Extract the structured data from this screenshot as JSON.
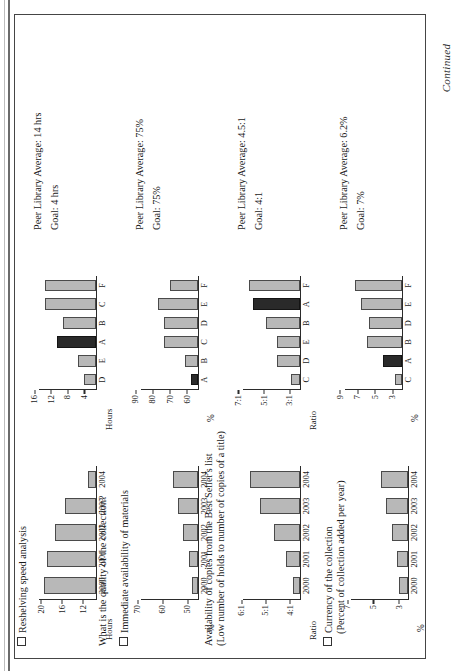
{
  "page": {
    "catchword": "Continued",
    "checkbox_icon": "empty-checkbox"
  },
  "sections": [
    {
      "heading": "Reshelving speed analysis",
      "question": "What is the quality of the collection?",
      "subhead": "",
      "notes": [
        "Peer Library Average: 14 hrs",
        "Goal: 4 hrs"
      ],
      "trend": {
        "type": "bar",
        "ylabel": "Hours",
        "categories": [
          "2000",
          "2001",
          "2002",
          "2003",
          "2004"
        ],
        "values": [
          21,
          20.5,
          19,
          17,
          12.5
        ],
        "yticks": [
          "12",
          "16",
          "20"
        ],
        "ytick_values": [
          12,
          16,
          20
        ],
        "ylim": [
          11,
          22
        ]
      },
      "peer": {
        "type": "bar",
        "ylabel": "Hours",
        "categories": [
          "D",
          "E",
          "A",
          "B",
          "C",
          "F"
        ],
        "values": [
          6,
          7.5,
          12.5,
          11,
          15.5,
          15.5
        ],
        "highlight": "A",
        "yticks": [
          "4",
          "8",
          "12",
          "16"
        ],
        "ytick_values": [
          4,
          8,
          12,
          16
        ],
        "ylim": [
          3,
          17
        ]
      }
    },
    {
      "heading": "Immediate availability of materials",
      "question": "",
      "subhead": "",
      "notes": [
        "Peer Library Average: 75%",
        "Goal: 75%"
      ],
      "trend": {
        "type": "bar",
        "ylabel": "%",
        "categories": [
          "2000",
          "2001",
          "2002",
          "2003",
          "2004"
        ],
        "values": [
          51.5,
          52.5,
          55,
          57,
          59
        ],
        "yticks": [
          "50",
          "60",
          "70"
        ],
        "ytick_values": [
          50,
          60,
          70
        ],
        "ylim": [
          49,
          72
        ]
      },
      "peer": {
        "type": "bar",
        "ylabel": "%",
        "categories": [
          "A",
          "B",
          "C",
          "D",
          "E",
          "F"
        ],
        "values": [
          62,
          66,
          78,
          78,
          82,
          75
        ],
        "highlight": "A",
        "yticks": [
          "60",
          "70",
          "80",
          "90"
        ],
        "ytick_values": [
          60,
          70,
          80,
          90
        ],
        "ylim": [
          58,
          92
        ]
      }
    },
    {
      "heading": "Availability of copies from the Best Seller's list",
      "subhead": "(Low number of holds to number of copies of a title)",
      "question": "",
      "notes": [
        "Peer Library Average: 4.5:1",
        "Goal: 4:1"
      ],
      "trend": {
        "type": "bar",
        "ylabel": "Ratio",
        "categories": [
          "2000",
          "2001",
          "2002",
          "2003",
          "2004"
        ],
        "values": [
          4.2,
          4.5,
          5.0,
          5.6,
          6.0
        ],
        "yticks": [
          "4:1",
          "5:1",
          "6:1"
        ],
        "ytick_values": [
          4,
          5,
          6
        ],
        "ylim": [
          3.9,
          6.3
        ]
      },
      "peer": {
        "type": "bar",
        "ylabel": "Ratio",
        "categories": [
          "C",
          "D",
          "E",
          "B",
          "A",
          "F"
        ],
        "values": [
          3.5,
          4.6,
          4.6,
          5.5,
          6.5,
          6.8
        ],
        "highlight": "A",
        "yticks": [
          "3:1",
          "5:1",
          "7:1"
        ],
        "ytick_values": [
          3,
          5,
          7
        ],
        "ylim": [
          2.8,
          7.3
        ]
      }
    },
    {
      "heading": "Currency of the collection",
      "subhead": "(Percent of collection added per year)",
      "question": "",
      "notes": [
        "Peer Library Average: 6.2%",
        "Goal: 7%"
      ],
      "trend": {
        "type": "bar",
        "ylabel": "%",
        "categories": [
          "2000",
          "2001",
          "2002",
          "2003",
          "2004"
        ],
        "values": [
          3.6,
          3.8,
          4.2,
          4.6,
          5.0
        ],
        "yticks": [
          "3",
          "5",
          "7"
        ],
        "ytick_values": [
          3,
          5,
          7
        ],
        "ylim": [
          2.9,
          7.4
        ]
      },
      "peer": {
        "type": "bar",
        "ylabel": "%",
        "categories": [
          "C",
          "A",
          "B",
          "D",
          "E",
          "F"
        ],
        "values": [
          3.6,
          5.0,
          6.8,
          6.6,
          7.6,
          8.2
        ],
        "highlight": "A",
        "yticks": [
          "3",
          "5",
          "7",
          "9"
        ],
        "ytick_values": [
          3,
          5,
          7,
          9
        ],
        "ylim": [
          2.8,
          9.4
        ]
      }
    }
  ],
  "colors": {
    "bar_fill": "#b8b8b8",
    "bar_highlight": "#2a2a2a",
    "axis": "#2b2b2b",
    "text": "#1a1a1a"
  }
}
